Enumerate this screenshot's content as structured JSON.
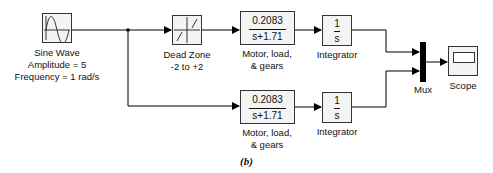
{
  "blocks": {
    "sine_wave": {
      "name": "Sine Wave",
      "param1": "Amplitude = 5",
      "param2": "Frequency = 1 rad/s"
    },
    "dead_zone": {
      "name": "Dead Zone",
      "param": "-2 to +2"
    },
    "motor_top": {
      "numerator": "0.2083",
      "denominator": "s+1.71",
      "label1": "Motor, load,",
      "label2": "& gears"
    },
    "motor_bottom": {
      "numerator": "0.2083",
      "denominator": "s+1.71",
      "label1": "Motor, load,",
      "label2": "& gears"
    },
    "integrator_top": {
      "numerator": "1",
      "denominator": "s",
      "name": "Integrator"
    },
    "integrator_bottom": {
      "numerator": "1",
      "denominator": "s",
      "name": "Integrator"
    },
    "mux": {
      "name": "Mux"
    },
    "scope": {
      "name": "Scope"
    }
  },
  "caption": "(b)"
}
